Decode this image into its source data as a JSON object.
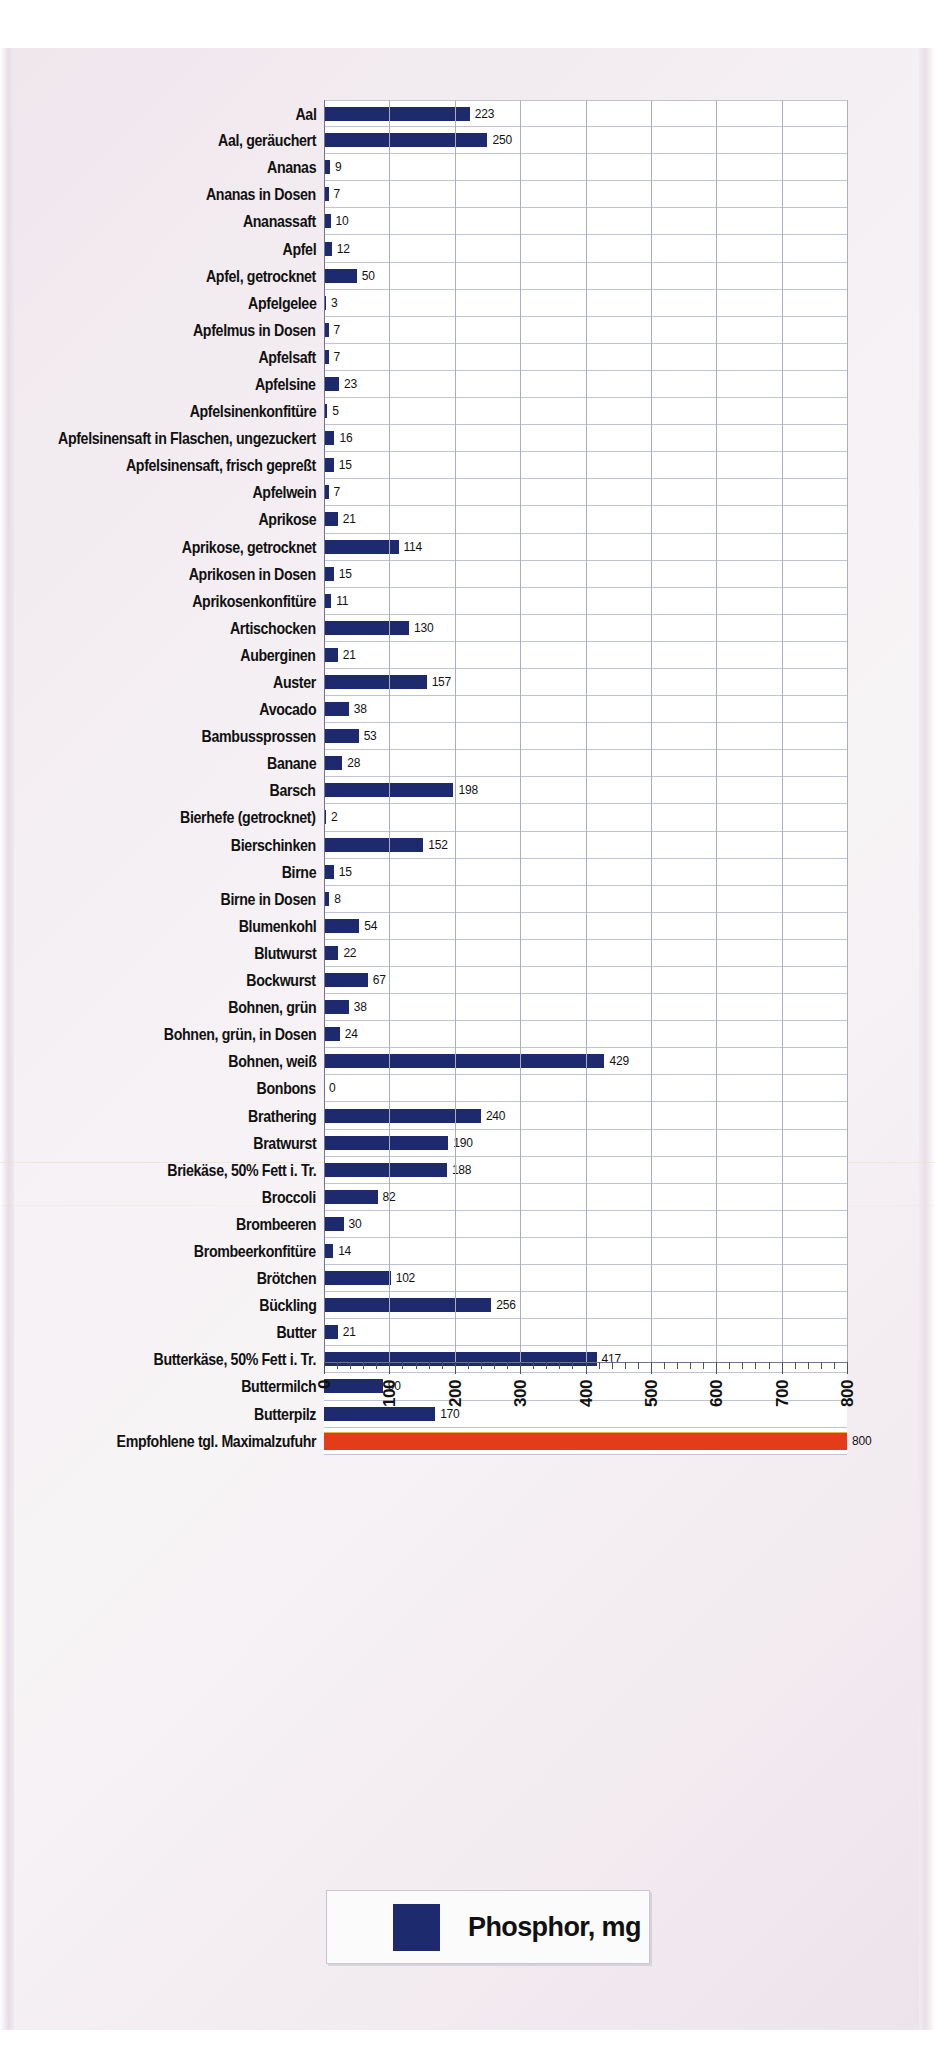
{
  "chart_data": {
    "type": "bar",
    "orientation": "horizontal",
    "title": "",
    "xlabel": "",
    "ylabel": "",
    "xlim": [
      0,
      800
    ],
    "xticks": [
      0,
      100,
      200,
      300,
      400,
      500,
      600,
      700,
      800
    ],
    "xtick_labels": [
      "0",
      "100",
      "200",
      "300",
      "400",
      "500",
      "600",
      "700",
      "800"
    ],
    "grid": true,
    "minor_ticks_per_interval": 5,
    "legend": {
      "position": "bottom",
      "label": "Phosphor, mg",
      "color": "#1d2a6d"
    },
    "colors": {
      "bar": "#1d2a6d",
      "reference_bar": "#e23c18",
      "plot_background": "#ffffff",
      "gridline": "#a9aec2",
      "page_background": "#f2eef1"
    },
    "categories": [
      "Aal",
      "Aal, geräuchert",
      "Ananas",
      "Ananas in Dosen",
      "Ananassaft",
      "Apfel",
      "Apfel, getrocknet",
      "Apfelgelee",
      "Apfelmus in Dosen",
      "Apfelsaft",
      "Apfelsine",
      "Apfelsinenkonfitüre",
      "Apfelsinensaft in Flaschen, ungezuckert",
      "Apfelsinensaft, frisch gepreßt",
      "Apfelwein",
      "Aprikose",
      "Aprikose, getrocknet",
      "Aprikosen in Dosen",
      "Aprikosenkonfitüre",
      "Artischocken",
      "Auberginen",
      "Auster",
      "Avocado",
      "Bambussprossen",
      "Banane",
      "Barsch",
      "Bierhefe (getrocknet)",
      "Bierschinken",
      "Birne",
      "Birne in Dosen",
      "Blumenkohl",
      "Blutwurst",
      "Bockwurst",
      "Bohnen, grün",
      "Bohnen, grün, in Dosen",
      "Bohnen, weiß",
      "Bonbons",
      "Brathering",
      "Bratwurst",
      "Briekäse, 50% Fett i. Tr.",
      "Broccoli",
      "Brombeeren",
      "Brombeerkonfitüre",
      "Brötchen",
      "Bückling",
      "Butter",
      "Butterkäse, 50% Fett i. Tr.",
      "Buttermilch",
      "Butterpilz",
      "Empfohlene tgl. Maximalzufuhr"
    ],
    "values": [
      223,
      250,
      9,
      7,
      10,
      12,
      50,
      3,
      7,
      7,
      23,
      5,
      16,
      15,
      7,
      21,
      114,
      15,
      11,
      130,
      21,
      157,
      38,
      53,
      28,
      198,
      2,
      152,
      15,
      8,
      54,
      22,
      67,
      38,
      24,
      429,
      0,
      240,
      190,
      188,
      82,
      30,
      14,
      102,
      256,
      21,
      417,
      90,
      170,
      800
    ],
    "reference_index": 49,
    "series_name": "Phosphor, mg",
    "unit": "mg"
  }
}
